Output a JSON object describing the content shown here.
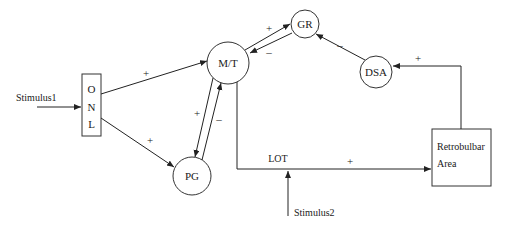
{
  "diagram": {
    "type": "neural circuit block diagram",
    "nodes": {
      "onl": {
        "label_letters": [
          "O",
          "N",
          "L"
        ],
        "shape": "rectangle"
      },
      "mt": {
        "label": "M/T",
        "shape": "circle"
      },
      "gr": {
        "label": "GR",
        "shape": "circle"
      },
      "dsa": {
        "label": "DSA",
        "shape": "circle"
      },
      "pg": {
        "label": "PG",
        "shape": "circle"
      },
      "retrobulbar": {
        "label_lines": [
          "Retrobulbar",
          "Area"
        ],
        "shape": "rectangle"
      }
    },
    "inputs": {
      "stimulus1": {
        "label": "Stimulus1"
      },
      "stimulus2": {
        "label": "Stimulus2"
      }
    },
    "pathway_labels": {
      "lot": "LOT"
    },
    "edges": [
      {
        "from": "Stimulus1",
        "to": "ONL",
        "sign": ""
      },
      {
        "from": "ONL",
        "to": "M/T",
        "sign": "+"
      },
      {
        "from": "ONL",
        "to": "PG",
        "sign": "+"
      },
      {
        "from": "M/T",
        "to": "GR",
        "sign": "+"
      },
      {
        "from": "GR",
        "to": "M/T",
        "sign": "–"
      },
      {
        "from": "M/T",
        "to": "PG",
        "sign": "+"
      },
      {
        "from": "PG",
        "to": "M/T",
        "sign": "–"
      },
      {
        "from": "M/T",
        "to": "Retrobulbar Area",
        "via": "LOT",
        "sign": "+"
      },
      {
        "from": "Stimulus2",
        "to": "LOT",
        "sign": ""
      },
      {
        "from": "Retrobulbar Area",
        "to": "DSA",
        "sign": "+"
      },
      {
        "from": "DSA",
        "to": "GR",
        "sign": "–"
      }
    ],
    "signs": {
      "plus": "+",
      "minus": "–"
    }
  }
}
